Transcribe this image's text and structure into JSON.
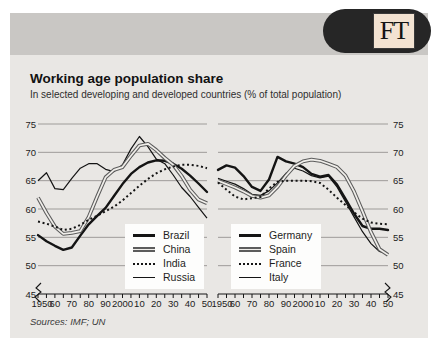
{
  "header": {
    "logo_text": "FT"
  },
  "title": "Working age population share",
  "subtitle": "In selected developing and developed countries (% of total population)",
  "source_note": "Sources: IMF; UN",
  "colors": {
    "card_bg": "#e9e7e4",
    "band_bg": "#c9c7c4",
    "pill_bg": "#262626",
    "logo_square_bg": "#f3e3d2",
    "line_dark": "#141414",
    "line_double_gray": "#5c5c5c",
    "gridline": "#9e9c99"
  },
  "axis": {
    "y_ticks": [
      75,
      70,
      65,
      60,
      55,
      50,
      45
    ],
    "y_min": 45,
    "y_max": 75,
    "x_tick_labels": [
      "1950",
      "60",
      "70",
      "80",
      "90",
      "2000",
      "10",
      "20",
      "30",
      "40",
      "50"
    ],
    "minor_tick_step_years": 5,
    "axis_break_at": 45
  },
  "chart_data": [
    {
      "type": "line",
      "panel": "developing-countries",
      "ylim": [
        45,
        75
      ],
      "x": [
        1950,
        1955,
        1960,
        1965,
        1970,
        1975,
        1980,
        1985,
        1990,
        1995,
        2000,
        2005,
        2010,
        2015,
        2020,
        2025,
        2030,
        2035,
        2040,
        2045,
        2050
      ],
      "series": [
        {
          "name": "Brazil",
          "style": "thick",
          "values": [
            55.4,
            54.3,
            53.5,
            52.8,
            53.2,
            55.3,
            57.3,
            58.8,
            60.2,
            62.3,
            64.4,
            66.2,
            67.4,
            68.2,
            68.6,
            68.5,
            68.0,
            67.1,
            65.9,
            64.5,
            63.0
          ]
        },
        {
          "name": "China",
          "style": "double",
          "values": [
            62.0,
            59.3,
            56.9,
            55.6,
            55.8,
            56.1,
            58.6,
            62.2,
            65.6,
            66.9,
            67.4,
            69.4,
            71.2,
            71.5,
            70.4,
            69.0,
            67.8,
            65.8,
            63.4,
            61.7,
            61.0
          ]
        },
        {
          "name": "India",
          "style": "dotted",
          "values": [
            57.8,
            57.4,
            56.9,
            56.3,
            56.5,
            57.2,
            58.1,
            58.8,
            59.6,
            60.4,
            61.5,
            62.8,
            64.1,
            65.3,
            66.3,
            67.0,
            67.5,
            67.8,
            67.8,
            67.6,
            67.2
          ]
        },
        {
          "name": "Russia",
          "style": "thin",
          "values": [
            65.0,
            66.4,
            63.6,
            63.4,
            65.4,
            67.2,
            68.0,
            68.0,
            67.0,
            66.6,
            67.8,
            70.6,
            72.8,
            71.0,
            68.8,
            68.0,
            66.0,
            63.8,
            62.2,
            60.3,
            58.4
          ]
        }
      ]
    },
    {
      "type": "line",
      "panel": "developed-countries",
      "ylim": [
        45,
        75
      ],
      "x": [
        1950,
        1955,
        1960,
        1965,
        1970,
        1975,
        1980,
        1985,
        1990,
        1995,
        2000,
        2005,
        2010,
        2015,
        2020,
        2025,
        2030,
        2035,
        2040,
        2045,
        2050
      ],
      "series": [
        {
          "name": "Germany",
          "style": "thick",
          "values": [
            66.9,
            67.7,
            67.3,
            65.8,
            63.9,
            63.2,
            65.2,
            69.2,
            68.4,
            68.0,
            67.4,
            66.2,
            65.7,
            66.0,
            64.3,
            61.8,
            59.2,
            57.0,
            56.5,
            56.5,
            56.3
          ]
        },
        {
          "name": "Spain",
          "style": "double",
          "values": [
            65.0,
            64.4,
            63.8,
            63.1,
            62.3,
            62.0,
            62.4,
            63.9,
            65.9,
            67.6,
            68.4,
            68.7,
            68.5,
            68.0,
            67.4,
            65.9,
            63.1,
            59.6,
            55.9,
            52.9,
            51.9
          ]
        },
        {
          "name": "France",
          "style": "dotted",
          "values": [
            64.7,
            63.4,
            62.2,
            61.7,
            61.9,
            62.1,
            63.6,
            64.8,
            65.0,
            65.0,
            65.0,
            64.9,
            64.6,
            63.4,
            62.0,
            60.7,
            59.4,
            58.3,
            57.6,
            57.4,
            57.3
          ]
        },
        {
          "name": "Italy",
          "style": "thin",
          "values": [
            65.4,
            64.9,
            64.4,
            63.6,
            62.6,
            62.4,
            63.2,
            64.6,
            66.3,
            67.2,
            66.7,
            65.9,
            65.5,
            65.8,
            63.9,
            61.3,
            58.6,
            56.0,
            53.9,
            52.5,
            52.0
          ]
        }
      ]
    }
  ]
}
